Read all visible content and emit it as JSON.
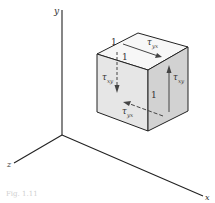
{
  "figure": {
    "caption": "Fig. 1.11",
    "axes": {
      "x_label": "x",
      "y_label": "y",
      "z_label": "z"
    },
    "cube": {
      "edge_length_labels": [
        "1",
        "1",
        "1"
      ],
      "stresses": {
        "top_face": {
          "symbol": "τ",
          "subscript": "yx"
        },
        "front_face_left": {
          "symbol": "τ",
          "subscript": "xy"
        },
        "right_face": {
          "symbol": "τ",
          "subscript": "xy"
        },
        "bottom_hidden": {
          "symbol": "τ",
          "subscript": "yx"
        }
      }
    },
    "colors": {
      "line": "#222222",
      "top_face": "#f7f7f7",
      "front_face": "#e6e6e6",
      "right_face": "#d2d2d2"
    }
  }
}
